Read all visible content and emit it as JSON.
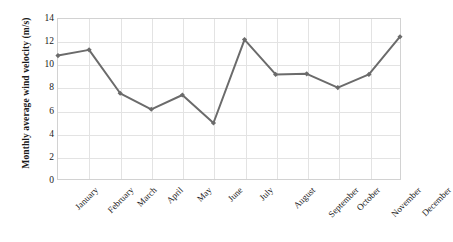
{
  "chart_data": {
    "type": "line",
    "title": "",
    "xlabel": "",
    "ylabel": "Monthly average wind velocity (m/s)",
    "categories": [
      "January",
      "February",
      "March",
      "April",
      "May",
      "June",
      "July",
      "August",
      "September",
      "October",
      "November",
      "December"
    ],
    "values": [
      10.8,
      11.3,
      7.5,
      6.1,
      7.35,
      4.9,
      12.2,
      9.15,
      9.2,
      8.0,
      9.15,
      12.45
    ],
    "ylim": [
      0,
      14
    ],
    "ytick_labels": [
      "0",
      "2",
      "4",
      "6",
      "8",
      "10",
      "12",
      "14"
    ],
    "ytick_values": [
      0,
      2,
      4,
      6,
      8,
      10,
      12,
      14
    ],
    "grid": "both",
    "legend": "none",
    "series": [
      {
        "name": "Monthly average wind velocity",
        "values": [
          10.8,
          11.3,
          7.5,
          6.1,
          7.35,
          4.9,
          12.2,
          9.15,
          9.2,
          8.0,
          9.15,
          12.45
        ]
      }
    ],
    "line_color": "#6b6b6b",
    "marker_color": "#6b6b6b",
    "marker": "diamond",
    "grid_color": "#e3e3e3",
    "axis_color": "#d2d2d2",
    "text_color": "#1a1a1a",
    "background_color": "#ffffff"
  }
}
